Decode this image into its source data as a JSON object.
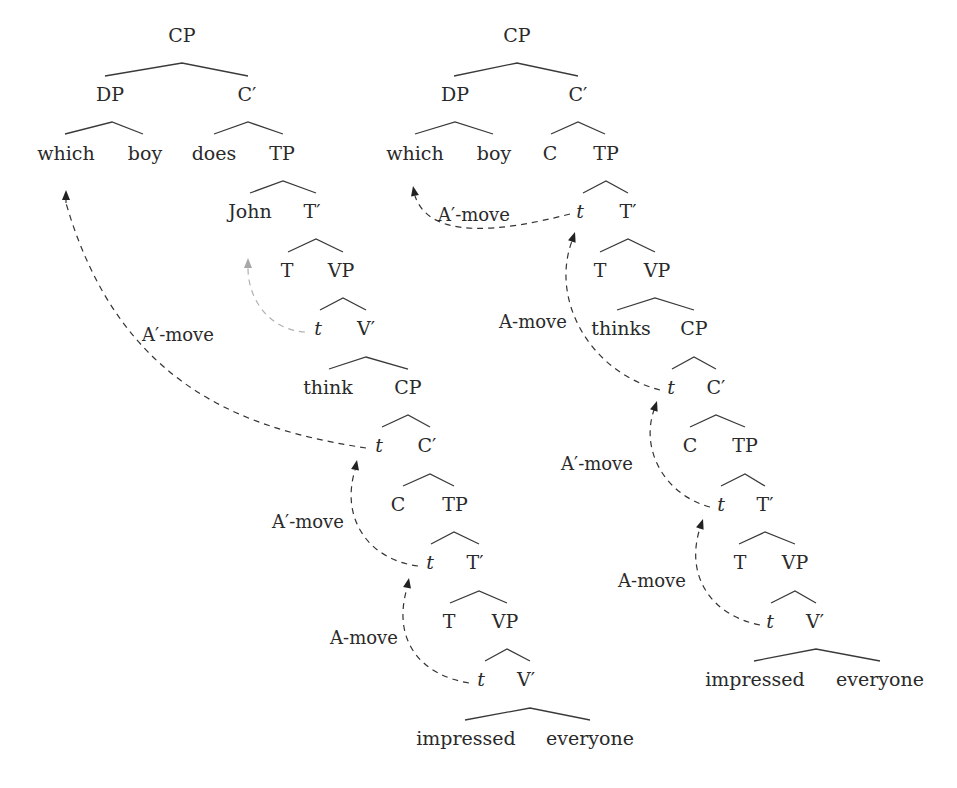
{
  "diagram": {
    "type": "syntax-tree-pair",
    "trees": [
      {
        "id": "left",
        "nodes": [
          {
            "id": "L-CP",
            "text": "CP",
            "x": 182,
            "y": 42
          },
          {
            "id": "L-DP",
            "text": "DP",
            "x": 110,
            "y": 101
          },
          {
            "id": "L-Cbar",
            "text": "C′",
            "x": 247,
            "y": 101
          },
          {
            "id": "L-which",
            "text": "which",
            "x": 66,
            "y": 160
          },
          {
            "id": "L-boy",
            "text": "boy",
            "x": 145,
            "y": 160
          },
          {
            "id": "L-does",
            "text": "does",
            "x": 214,
            "y": 160
          },
          {
            "id": "L-TP",
            "text": "TP",
            "x": 282,
            "y": 160
          },
          {
            "id": "L-John",
            "text": "John",
            "x": 250,
            "y": 218
          },
          {
            "id": "L-Tbar",
            "text": "T′",
            "x": 312,
            "y": 218
          },
          {
            "id": "L-T",
            "text": "T",
            "x": 287,
            "y": 277
          },
          {
            "id": "L-VP",
            "text": "VP",
            "x": 341,
            "y": 277
          },
          {
            "id": "L-t1",
            "text": "t",
            "x": 318,
            "y": 335,
            "trace": true
          },
          {
            "id": "L-Vbar",
            "text": "V′",
            "x": 366,
            "y": 335
          },
          {
            "id": "L-think",
            "text": "think",
            "x": 328,
            "y": 394
          },
          {
            "id": "L-CP2",
            "text": "CP",
            "x": 408,
            "y": 394
          },
          {
            "id": "L-t2",
            "text": "t",
            "x": 379,
            "y": 452,
            "trace": true
          },
          {
            "id": "L-Cbar2",
            "text": "C′",
            "x": 427,
            "y": 452
          },
          {
            "id": "L-C",
            "text": "C",
            "x": 398,
            "y": 511
          },
          {
            "id": "L-TP2",
            "text": "TP",
            "x": 455,
            "y": 511
          },
          {
            "id": "L-t3",
            "text": "t",
            "x": 430,
            "y": 569,
            "trace": true
          },
          {
            "id": "L-Tbar2",
            "text": "T′",
            "x": 475,
            "y": 569
          },
          {
            "id": "L-T2",
            "text": "T",
            "x": 449,
            "y": 628
          },
          {
            "id": "L-VP2",
            "text": "VP",
            "x": 505,
            "y": 628
          },
          {
            "id": "L-t4",
            "text": "t",
            "x": 481,
            "y": 686,
            "trace": true
          },
          {
            "id": "L-Vbar2",
            "text": "V′",
            "x": 526,
            "y": 686
          },
          {
            "id": "L-impressed",
            "text": "impressed",
            "x": 466,
            "y": 745
          },
          {
            "id": "L-everyone",
            "text": "everyone",
            "x": 590,
            "y": 745
          }
        ],
        "branches": [
          {
            "from": [
              182,
              63
            ],
            "to": [
              [
                105,
                76
              ],
              [
                248,
                76
              ]
            ]
          },
          {
            "from": [
              112,
              122
            ],
            "to": [
              [
                65,
                134
              ],
              [
                143,
                134
              ]
            ]
          },
          {
            "from": [
              248,
              122
            ],
            "to": [
              [
                214,
                134
              ],
              [
                283,
                134
              ]
            ]
          },
          {
            "from": [
              283,
              181
            ],
            "to": [
              [
                250,
                193
              ],
              [
                316,
                193
              ]
            ]
          },
          {
            "from": [
              316,
              239
            ],
            "to": [
              [
                288,
                252
              ],
              [
                343,
                252
              ]
            ]
          },
          {
            "from": [
              343,
              298
            ],
            "to": [
              [
                320,
                310
              ],
              [
                366,
                310
              ]
            ]
          },
          {
            "from": [
              366,
              357
            ],
            "to": [
              [
                329,
                369
              ],
              [
                408,
                369
              ]
            ]
          },
          {
            "from": [
              408,
              415
            ],
            "to": [
              [
                382,
                427
              ],
              [
                430,
                427
              ]
            ]
          },
          {
            "from": [
              430,
              474
            ],
            "to": [
              [
                403,
                486
              ],
              [
                454,
                486
              ]
            ]
          },
          {
            "from": [
              454,
              532
            ],
            "to": [
              [
                431,
                544
              ],
              [
                479,
                544
              ]
            ]
          },
          {
            "from": [
              479,
              591
            ],
            "to": [
              [
                450,
                603
              ],
              [
                507,
                603
              ]
            ]
          },
          {
            "from": [
              507,
              649
            ],
            "to": [
              [
                485,
                661
              ],
              [
                530,
                661
              ]
            ]
          },
          {
            "from": [
              530,
              708
            ],
            "to": [
              [
                465,
                720
              ],
              [
                590,
                720
              ]
            ]
          }
        ]
      },
      {
        "id": "right",
        "nodes": [
          {
            "id": "R-CP",
            "text": "CP",
            "x": 517,
            "y": 42
          },
          {
            "id": "R-DP",
            "text": "DP",
            "x": 455,
            "y": 101
          },
          {
            "id": "R-Cbar",
            "text": "C′",
            "x": 578,
            "y": 101
          },
          {
            "id": "R-which",
            "text": "which",
            "x": 415,
            "y": 160
          },
          {
            "id": "R-boy",
            "text": "boy",
            "x": 494,
            "y": 160
          },
          {
            "id": "R-C",
            "text": "C",
            "x": 550,
            "y": 160
          },
          {
            "id": "R-TP",
            "text": "TP",
            "x": 606,
            "y": 160
          },
          {
            "id": "R-t1",
            "text": "t",
            "x": 580,
            "y": 218,
            "trace": true
          },
          {
            "id": "R-Tbar",
            "text": "T′",
            "x": 628,
            "y": 218
          },
          {
            "id": "R-T",
            "text": "T",
            "x": 600,
            "y": 277
          },
          {
            "id": "R-VP",
            "text": "VP",
            "x": 657,
            "y": 277
          },
          {
            "id": "R-thinks",
            "text": "thinks",
            "x": 621,
            "y": 335
          },
          {
            "id": "R-CP2",
            "text": "CP",
            "x": 694,
            "y": 335
          },
          {
            "id": "R-t2",
            "text": "t",
            "x": 671,
            "y": 394,
            "trace": true
          },
          {
            "id": "R-Cbar2",
            "text": "C′",
            "x": 716,
            "y": 394
          },
          {
            "id": "R-C2",
            "text": "C",
            "x": 690,
            "y": 452
          },
          {
            "id": "R-TP2",
            "text": "TP",
            "x": 745,
            "y": 452
          },
          {
            "id": "R-t3",
            "text": "t",
            "x": 721,
            "y": 511,
            "trace": true
          },
          {
            "id": "R-Tbar2",
            "text": "T′",
            "x": 765,
            "y": 511
          },
          {
            "id": "R-T2",
            "text": "T",
            "x": 740,
            "y": 569
          },
          {
            "id": "R-VP2",
            "text": "VP",
            "x": 795,
            "y": 569
          },
          {
            "id": "R-t4",
            "text": "t",
            "x": 770,
            "y": 628,
            "trace": true
          },
          {
            "id": "R-Vbar",
            "text": "V′",
            "x": 815,
            "y": 628
          },
          {
            "id": "R-impressed",
            "text": "impressed",
            "x": 755,
            "y": 686
          },
          {
            "id": "R-everyone",
            "text": "everyone",
            "x": 880,
            "y": 686
          }
        ],
        "branches": [
          {
            "from": [
              517,
              63
            ],
            "to": [
              [
                454,
                76
              ],
              [
                578,
                76
              ]
            ]
          },
          {
            "from": [
              455,
              122
            ],
            "to": [
              [
                415,
                134
              ],
              [
                493,
                134
              ]
            ]
          },
          {
            "from": [
              578,
              122
            ],
            "to": [
              [
                551,
                134
              ],
              [
                605,
                134
              ]
            ]
          },
          {
            "from": [
              606,
              181
            ],
            "to": [
              [
                583,
                193
              ],
              [
                628,
                193
              ]
            ]
          },
          {
            "from": [
              628,
              239
            ],
            "to": [
              [
                600,
                252
              ],
              [
                655,
                252
              ]
            ]
          },
          {
            "from": [
              655,
              298
            ],
            "to": [
              [
                617,
                310
              ],
              [
                694,
                310
              ]
            ]
          },
          {
            "from": [
              694,
              357
            ],
            "to": [
              [
                672,
                369
              ],
              [
                716,
                369
              ]
            ]
          },
          {
            "from": [
              716,
              415
            ],
            "to": [
              [
                690,
                427
              ],
              [
                745,
                427
              ]
            ]
          },
          {
            "from": [
              745,
              474
            ],
            "to": [
              [
                721,
                486
              ],
              [
                765,
                486
              ]
            ]
          },
          {
            "from": [
              765,
              532
            ],
            "to": [
              [
                739,
                544
              ],
              [
                795,
                544
              ]
            ]
          },
          {
            "from": [
              795,
              591
            ],
            "to": [
              [
                771,
                603
              ],
              [
                816,
                603
              ]
            ]
          },
          {
            "from": [
              816,
              649
            ],
            "to": [
              [
                754,
                661
              ],
              [
                880,
                661
              ]
            ]
          }
        ]
      }
    ],
    "movements": [
      {
        "id": "L-move-John",
        "label": "",
        "type": "A-move",
        "light": true,
        "path": "M 305 332 C 270 330, 248 300, 248 268",
        "arrow": [
          248,
          258
        ]
      },
      {
        "id": "L-move-which",
        "label": "A′-move",
        "label_x": 178,
        "label_y": 341,
        "path": "M 366 448 C 250 430, 120 390, 66 203",
        "arrow": [
          66,
          190
        ]
      },
      {
        "id": "L-move-t3-t2",
        "label": "A′-move",
        "label_x": 308,
        "label_y": 528,
        "path": "M 418 566 C 370 560, 340 520, 355 470",
        "arrow": [
          357,
          460
        ]
      },
      {
        "id": "L-move-t4-t3",
        "label": "A-move",
        "label_x": 364,
        "label_y": 644,
        "path": "M 469 683 C 420 675, 392 640, 407 588",
        "arrow": [
          409,
          578
        ]
      },
      {
        "id": "R-move-which",
        "label": "A′-move",
        "label_x": 474,
        "label_y": 221,
        "path": "M 570 214 C 500 232, 430 240, 415 196",
        "arrow": [
          413,
          186
        ]
      },
      {
        "id": "R-move-t2-t1",
        "label": "A-move",
        "label_x": 533,
        "label_y": 328,
        "path": "M 660 390 C 590 372, 550 300, 572 241",
        "arrow": [
          575,
          232
        ]
      },
      {
        "id": "R-move-t3-t2",
        "label": "A′-move",
        "label_x": 597,
        "label_y": 470,
        "path": "M 710 507 C 665 495, 640 450, 654 410",
        "arrow": [
          657,
          401
        ]
      },
      {
        "id": "R-move-t4-t3",
        "label": "A-move",
        "label_x": 652,
        "label_y": 587,
        "path": "M 760 625 C 710 615, 685 575, 700 528",
        "arrow": [
          703,
          519
        ]
      }
    ]
  }
}
